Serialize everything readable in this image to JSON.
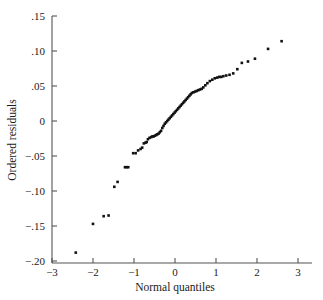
{
  "chart_data": {
    "type": "scatter",
    "title": "",
    "subtitle": "",
    "xlabel": "Normal quantiles",
    "ylabel": "Ordered residuals",
    "xlim": [
      -3,
      3
    ],
    "ylim": [
      -0.2,
      0.15
    ],
    "grid": false,
    "legend": null,
    "xticks": [
      -3,
      -2,
      -1,
      0,
      1,
      2,
      3
    ],
    "xtick_labels": [
      "−3",
      "−2",
      "−1",
      "0",
      "1",
      "2",
      "3"
    ],
    "yticks": [
      0.15,
      0.1,
      0.05,
      0,
      -0.05,
      -0.1,
      -0.15,
      -0.2
    ],
    "ytick_labels": [
      ".15",
      ".10",
      ".05",
      "0",
      "−.05",
      "−.10",
      "−.15",
      "−.20"
    ],
    "marker": "filled-square",
    "marker_color": "#111111",
    "series": [
      {
        "name": "ordered residuals",
        "x": [
          -2.42,
          -2.0,
          -1.74,
          -1.62,
          -1.48,
          -1.4,
          -1.22,
          -1.18,
          -1.14,
          -1.02,
          -0.96,
          -0.9,
          -0.84,
          -0.8,
          -0.76,
          -0.72,
          -0.69,
          -0.66,
          -0.62,
          -0.58,
          -0.55,
          -0.52,
          -0.49,
          -0.46,
          -0.43,
          -0.4,
          -0.37,
          -0.34,
          -0.31,
          -0.28,
          -0.25,
          -0.22,
          -0.19,
          -0.16,
          -0.13,
          -0.1,
          -0.07,
          -0.04,
          -0.01,
          0.02,
          0.05,
          0.08,
          0.11,
          0.14,
          0.17,
          0.2,
          0.23,
          0.26,
          0.29,
          0.32,
          0.35,
          0.38,
          0.41,
          0.45,
          0.49,
          0.53,
          0.57,
          0.61,
          0.65,
          0.69,
          0.74,
          0.79,
          0.85,
          0.91,
          0.97,
          1.03,
          1.08,
          1.13,
          1.18,
          1.25,
          1.33,
          1.42,
          1.52,
          1.63,
          1.78,
          1.95,
          2.27,
          2.6
        ],
        "y": [
          -0.188,
          -0.147,
          -0.136,
          -0.135,
          -0.094,
          -0.087,
          -0.066,
          -0.066,
          -0.066,
          -0.046,
          -0.046,
          -0.042,
          -0.04,
          -0.038,
          -0.032,
          -0.031,
          -0.03,
          -0.026,
          -0.024,
          -0.023,
          -0.022,
          -0.022,
          -0.021,
          -0.02,
          -0.019,
          -0.018,
          -0.016,
          -0.014,
          -0.01,
          -0.007,
          -0.004,
          -0.002,
          0.0,
          0.002,
          0.004,
          0.006,
          0.008,
          0.01,
          0.012,
          0.014,
          0.016,
          0.018,
          0.02,
          0.022,
          0.024,
          0.026,
          0.028,
          0.03,
          0.032,
          0.034,
          0.036,
          0.038,
          0.04,
          0.041,
          0.042,
          0.043,
          0.044,
          0.045,
          0.046,
          0.048,
          0.051,
          0.054,
          0.057,
          0.059,
          0.061,
          0.062,
          0.063,
          0.063,
          0.064,
          0.065,
          0.066,
          0.068,
          0.074,
          0.083,
          0.085,
          0.089,
          0.103,
          0.114
        ]
      }
    ]
  }
}
